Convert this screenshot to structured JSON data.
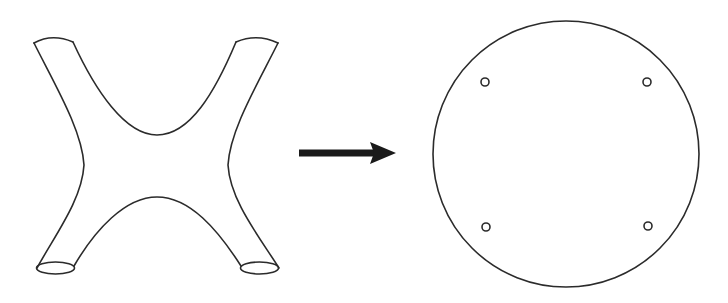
{
  "diagram": {
    "type": "topology-transformation",
    "stroke_color": "#2b2b2b",
    "arrow_color": "#1a1a1a",
    "background": "#ffffff",
    "nodes": [
      {
        "id": "surface",
        "label": "",
        "shape": "X-shaped surface with four boundary ends",
        "boundary_components": 4
      },
      {
        "id": "disk",
        "label": "",
        "shape": "circle with four small holes",
        "holes": 4
      }
    ],
    "edges": [
      {
        "from": "surface",
        "to": "disk",
        "style": "thick arrow",
        "label": ""
      }
    ]
  }
}
